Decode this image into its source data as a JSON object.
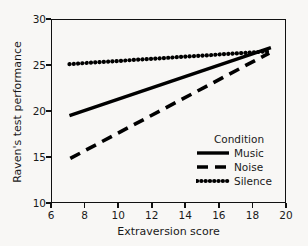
{
  "chart_data": {
    "type": "line",
    "title": "",
    "xlabel": "Extraversion score",
    "ylabel": "Raven's test performance",
    "xlim": [
      6,
      20
    ],
    "ylim": [
      10,
      30
    ],
    "xticks": [
      6,
      8,
      10,
      12,
      14,
      16,
      18,
      20
    ],
    "yticks": [
      10,
      15,
      20,
      25,
      30
    ],
    "grid": false,
    "legend_position": "bottom-right-inside",
    "legend_title": "Condition",
    "series": [
      {
        "name": "Music",
        "linestyle": "solid",
        "color": "#000000",
        "x": [
          7.1,
          19.1
        ],
        "y": [
          19.5,
          26.9
        ]
      },
      {
        "name": "Noise",
        "linestyle": "dashed",
        "color": "#000000",
        "x": [
          7.15,
          19.0
        ],
        "y": [
          14.85,
          26.3
        ]
      },
      {
        "name": "Silence",
        "linestyle": "dotted",
        "color": "#000000",
        "x": [
          7.1,
          19.1
        ],
        "y": [
          25.1,
          26.5
        ]
      }
    ]
  },
  "axes": {
    "x_tick_labels": [
      "6",
      "8",
      "10",
      "12",
      "14",
      "16",
      "18",
      "20"
    ],
    "y_tick_labels": [
      "10",
      "15",
      "20",
      "25",
      "30"
    ],
    "x_title": "Extraversion score",
    "y_title": "Raven's test performance"
  },
  "legend": {
    "title": "Condition",
    "entries": [
      {
        "label": "Music",
        "style": "solid"
      },
      {
        "label": "Noise",
        "style": "dashed"
      },
      {
        "label": "Silence",
        "style": "dotted"
      }
    ]
  },
  "style": {
    "background": "#f8f7f5",
    "line_color": "#000000",
    "axis_color": "#111111"
  }
}
